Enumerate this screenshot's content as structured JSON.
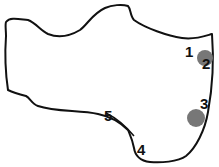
{
  "diagram": {
    "outline_color": "#111111",
    "marker_color": "#777777",
    "labels": [
      {
        "text": "1",
        "x": 185,
        "y": 44
      },
      {
        "text": "2",
        "x": 202,
        "y": 56
      },
      {
        "text": "3",
        "x": 200,
        "y": 96
      },
      {
        "text": "4",
        "x": 137,
        "y": 142
      },
      {
        "text": "5",
        "x": 104,
        "y": 108
      }
    ],
    "markers": [
      {
        "name": "marker-near-2",
        "cx": 205,
        "cy": 58,
        "r": 8
      },
      {
        "name": "marker-near-3",
        "cx": 196,
        "cy": 118,
        "r": 9
      }
    ]
  }
}
